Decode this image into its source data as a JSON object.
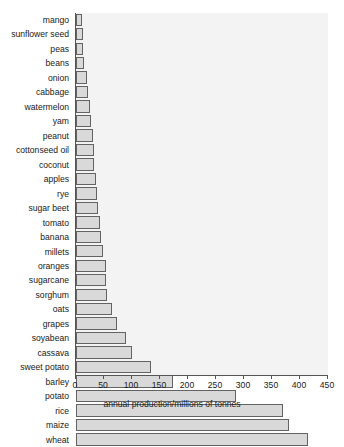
{
  "chart_data": {
    "type": "bar",
    "orientation": "horizontal",
    "title": "",
    "xlabel": "annual production/millions of tonnes",
    "ylabel": "",
    "xlim": [
      0,
      450
    ],
    "xticks": [
      0,
      50,
      100,
      150,
      200,
      250,
      300,
      350,
      400,
      450
    ],
    "grid": false,
    "legend": null,
    "categories": [
      "mango",
      "sunflower seed",
      "peas",
      "beans",
      "onion",
      "cabbage",
      "watermelon",
      "yam",
      "peanut",
      "cottonseed oil",
      "coconut",
      "apples",
      "rye",
      "sugar beet",
      "tomato",
      "banana",
      "millets",
      "oranges",
      "sugarcane",
      "sorghum",
      "oats",
      "grapes",
      "soyabean",
      "cassava",
      "sweet potato",
      "barley",
      "potato",
      "rice",
      "maize",
      "wheat"
    ],
    "values": [
      11,
      12,
      13,
      14,
      20,
      22,
      25,
      27,
      30,
      32,
      33,
      35,
      37,
      39,
      43,
      45,
      48,
      53,
      54,
      55,
      65,
      73,
      89,
      100,
      134,
      173,
      285,
      370,
      380,
      415
    ],
    "bar_fill_color": "#d9d9d9",
    "bar_edge_color": "#636363",
    "plot_background_color": "#f3f3f3",
    "axis_color": "#555555",
    "text_color": "#1a1a1a"
  }
}
